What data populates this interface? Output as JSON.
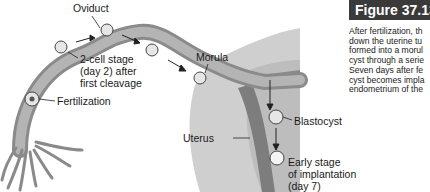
{
  "figure": {
    "title": "Figure 37.13",
    "caption_lines": [
      "After fertilization, th",
      "down the uterine tu",
      "formed into a morul",
      "cyst through a serie",
      "Seven days after fe",
      "cyst becomes impla",
      "endometrium of the"
    ]
  },
  "diagram": {
    "labels": {
      "oviduct": "Oviduct",
      "two_cell_1": "2-cell stage",
      "two_cell_2": "(day 2) after",
      "two_cell_3": "first cleavage",
      "morula": "Morula",
      "fertilization": "Fertilization",
      "uterus": "Uterus",
      "blastocyst": "Blastocyst",
      "implant_1": "Early stage",
      "implant_2": "of implantation",
      "implant_3": "(day 7)"
    },
    "colors": {
      "tube": "#9a9a9a",
      "tube_dark": "#6e6e6e",
      "uterus_wall": "#c8c8c8",
      "endometrium": "#8c8c8c",
      "title_bg": "#3a3a3a"
    }
  }
}
